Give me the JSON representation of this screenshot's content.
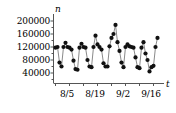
{
  "chart_data": {
    "type": "scatter",
    "title": "",
    "subtitle": "",
    "xlabel": "t",
    "ylabel": "n",
    "grid": false,
    "legend": null,
    "marker": "filled-circle",
    "line_style": "solid-thin-connecting-line",
    "xlim": [
      0,
      52
    ],
    "ylim": [
      0,
      215000
    ],
    "yticks": [
      40000,
      80000,
      120000,
      160000,
      200000
    ],
    "ytick_labels": [
      "40000",
      "80000",
      "120000",
      "160000",
      "200000"
    ],
    "xticks": [
      4,
      18,
      32,
      46
    ],
    "xtick_labels": [
      "8/5",
      "8/19",
      "9/2",
      "9/16"
    ],
    "x_unit": "days since 8/1",
    "note": "Weekly periodic series: weekday counts near 110000-135000, weekend counts drop to 40000-70000",
    "points": [
      {
        "x": 0,
        "date": "8/1",
        "y": 118000
      },
      {
        "x": 1,
        "date": "8/2",
        "y": 120000
      },
      {
        "x": 2,
        "date": "8/3",
        "y": 72000
      },
      {
        "x": 3,
        "date": "8/4",
        "y": 60000
      },
      {
        "x": 4,
        "date": "8/5",
        "y": 120000
      },
      {
        "x": 5,
        "date": "8/6",
        "y": 133000
      },
      {
        "x": 6,
        "date": "8/7",
        "y": 120000
      },
      {
        "x": 7,
        "date": "8/8",
        "y": 118000
      },
      {
        "x": 8,
        "date": "8/9",
        "y": 112000
      },
      {
        "x": 9,
        "date": "8/10",
        "y": 78000
      },
      {
        "x": 10,
        "date": "8/11",
        "y": 52000
      },
      {
        "x": 11,
        "date": "8/12",
        "y": 50000
      },
      {
        "x": 12,
        "date": "8/13",
        "y": 118000
      },
      {
        "x": 13,
        "date": "8/14",
        "y": 130000
      },
      {
        "x": 14,
        "date": "8/15",
        "y": 120000
      },
      {
        "x": 15,
        "date": "8/16",
        "y": 118000
      },
      {
        "x": 16,
        "date": "8/17",
        "y": 80000
      },
      {
        "x": 17,
        "date": "8/18",
        "y": 60000
      },
      {
        "x": 18,
        "date": "8/19",
        "y": 58000
      },
      {
        "x": 19,
        "date": "8/20",
        "y": 120000
      },
      {
        "x": 20,
        "date": "8/21",
        "y": 155000
      },
      {
        "x": 21,
        "date": "8/22",
        "y": 128000
      },
      {
        "x": 22,
        "date": "8/23",
        "y": 120000
      },
      {
        "x": 23,
        "date": "8/24",
        "y": 112000
      },
      {
        "x": 24,
        "date": "8/25",
        "y": 70000
      },
      {
        "x": 25,
        "date": "8/26",
        "y": 60000
      },
      {
        "x": 26,
        "date": "8/27",
        "y": 60000
      },
      {
        "x": 27,
        "date": "8/28",
        "y": 122000
      },
      {
        "x": 28,
        "date": "8/29",
        "y": 148000
      },
      {
        "x": 29,
        "date": "8/30",
        "y": 160000
      },
      {
        "x": 30,
        "date": "8/31",
        "y": 188000
      },
      {
        "x": 31,
        "date": "9/1",
        "y": 135000
      },
      {
        "x": 32,
        "date": "9/2",
        "y": 108000
      },
      {
        "x": 33,
        "date": "9/3",
        "y": 72000
      },
      {
        "x": 34,
        "date": "9/4",
        "y": 58000
      },
      {
        "x": 35,
        "date": "9/5",
        "y": 120000
      },
      {
        "x": 36,
        "date": "9/6",
        "y": 128000
      },
      {
        "x": 37,
        "date": "9/7",
        "y": 122000
      },
      {
        "x": 38,
        "date": "9/8",
        "y": 120000
      },
      {
        "x": 39,
        "date": "9/9",
        "y": 118000
      },
      {
        "x": 40,
        "date": "9/10",
        "y": 88000
      },
      {
        "x": 41,
        "date": "9/11",
        "y": 58000
      },
      {
        "x": 42,
        "date": "9/12",
        "y": 55000
      },
      {
        "x": 43,
        "date": "9/13",
        "y": 118000
      },
      {
        "x": 44,
        "date": "9/14",
        "y": 135000
      },
      {
        "x": 45,
        "date": "9/15",
        "y": 100000
      },
      {
        "x": 46,
        "date": "9/16",
        "y": 80000
      },
      {
        "x": 47,
        "date": "9/17",
        "y": 45000
      },
      {
        "x": 48,
        "date": "9/18",
        "y": 58000
      },
      {
        "x": 49,
        "date": "9/19",
        "y": 62000
      },
      {
        "x": 50,
        "date": "9/20",
        "y": 120000
      },
      {
        "x": 51,
        "date": "9/21",
        "y": 148000
      }
    ]
  },
  "axes": {
    "y_axis_name": "n",
    "x_axis_name": "t",
    "y_tick_labels": [
      "200000",
      "160000",
      "120000",
      "80000",
      "40000"
    ],
    "x_tick_labels": [
      "8/5",
      "8/19",
      "9/2",
      "9/16"
    ]
  },
  "style": {
    "axis_color": "#555555",
    "marker_color": "#111111",
    "line_color": "#6b6b6b",
    "text_color": "#000000",
    "background": "#ffffff"
  }
}
